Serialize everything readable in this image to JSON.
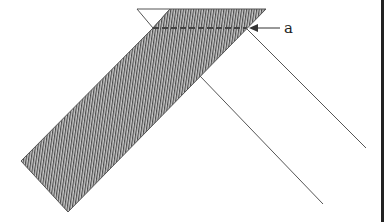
{
  "diagram": {
    "label_a": "a",
    "colors": {
      "line": "#555555",
      "hatch": "#444444",
      "fill": "#bdbdbd",
      "border": "#222222"
    }
  }
}
